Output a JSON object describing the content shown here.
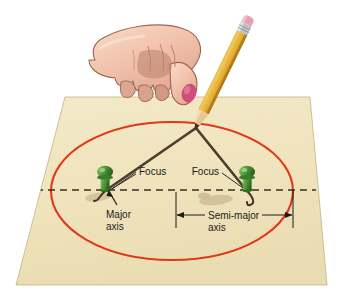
{
  "labels": {
    "focus_left": "Focus",
    "focus_right": "Focus",
    "major_axis_line1": "Major",
    "major_axis_line2": "axis",
    "semi_major_line1": "Semi-major",
    "semi_major_line2": "axis"
  },
  "colors": {
    "paper": "#f3e7bf",
    "paper_shade": "#ece0b2",
    "paper_edge": "#cbbc8c",
    "ellipse": "#e0391a",
    "string": "#4a3b2a",
    "axis_dash": "#3b2f20",
    "pushpin_body": "#4f9a3d",
    "pushpin_dark": "#2f6b25",
    "pushpin_light": "#86c26b",
    "pencil_body": "#e8b43a",
    "pencil_body_dark": "#c7912a",
    "pencil_wood": "#e3c48a",
    "pencil_lead": "#3a3026",
    "ferrule": "#b9bcc0",
    "eraser": "#e8a0b4",
    "skin": "#f3c6b2",
    "skin_shadow": "#dfa791",
    "skin_line": "#a9705c",
    "nail": "#cf4d78",
    "label_text": "#1b1b1b",
    "shadow": "#cbb98f",
    "background": "#ffffff"
  },
  "geometry": {
    "paper_corners": "65,97 310,97 327,285 16,285",
    "ellipse_center_x": 172,
    "ellipse_center_y": 191,
    "ellipse_rx": 121,
    "ellipse_ry": 69,
    "focus_left_x": 106,
    "focus_left_y": 191,
    "focus_right_x": 247,
    "focus_right_y": 191,
    "pencil_point_x": 196,
    "pencil_point_y": 127,
    "axis_line_y": 190,
    "axis_line_x1": 24,
    "axis_line_x2": 316,
    "semi_major_left_x": 176,
    "semi_major_right_x": 293,
    "semi_major_bar_y": 215
  }
}
